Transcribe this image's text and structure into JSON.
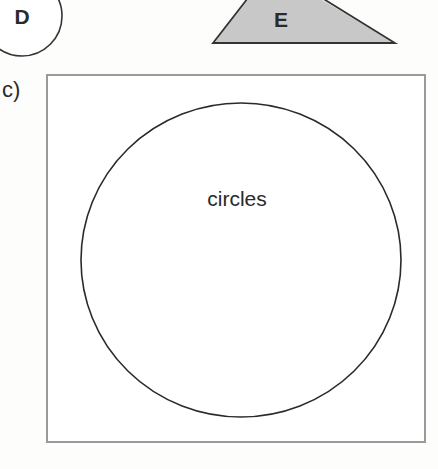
{
  "shapes": {
    "circle_d": {
      "label": "D",
      "fill": "#ffffff",
      "stroke": "#333333"
    },
    "triangle_e": {
      "label": "E",
      "fill": "#c8c8c8",
      "stroke": "#333333"
    }
  },
  "part_c": {
    "label": "c)",
    "diagram": {
      "type": "venn",
      "universal_set_border": "#9a9a9a",
      "sets": [
        {
          "label": "circles",
          "stroke": "#2a2a2a"
        }
      ]
    }
  }
}
